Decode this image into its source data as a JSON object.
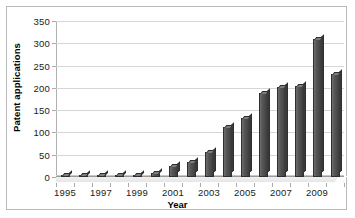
{
  "chart_data": {
    "type": "bar",
    "title": "",
    "xlabel": "Year",
    "ylabel": "Patent applications",
    "categories": [
      "1995",
      "1996",
      "1997",
      "1998",
      "1999",
      "2000",
      "2001",
      "2002",
      "2003",
      "2004",
      "2005",
      "2006",
      "2007",
      "2008",
      "2009",
      "2010"
    ],
    "values": [
      2,
      3,
      4,
      3,
      5,
      8,
      25,
      33,
      57,
      112,
      133,
      188,
      203,
      205,
      310,
      232
    ],
    "ylim": [
      0,
      350
    ],
    "yticks": [
      0,
      50,
      100,
      150,
      200,
      250,
      300,
      350
    ],
    "xtick_labels": [
      "1995",
      "1997",
      "1999",
      "2001",
      "2003",
      "2005",
      "2007",
      "2009"
    ],
    "xtick_categories": [
      "1995",
      "1997",
      "1999",
      "2001",
      "2003",
      "2005",
      "2007",
      "2009"
    ],
    "grid": "horizontal",
    "legend": "none",
    "series_color": "#4a4a4a",
    "gridline_color": "#d6d6d6",
    "border_color": "#b9b9b9"
  }
}
